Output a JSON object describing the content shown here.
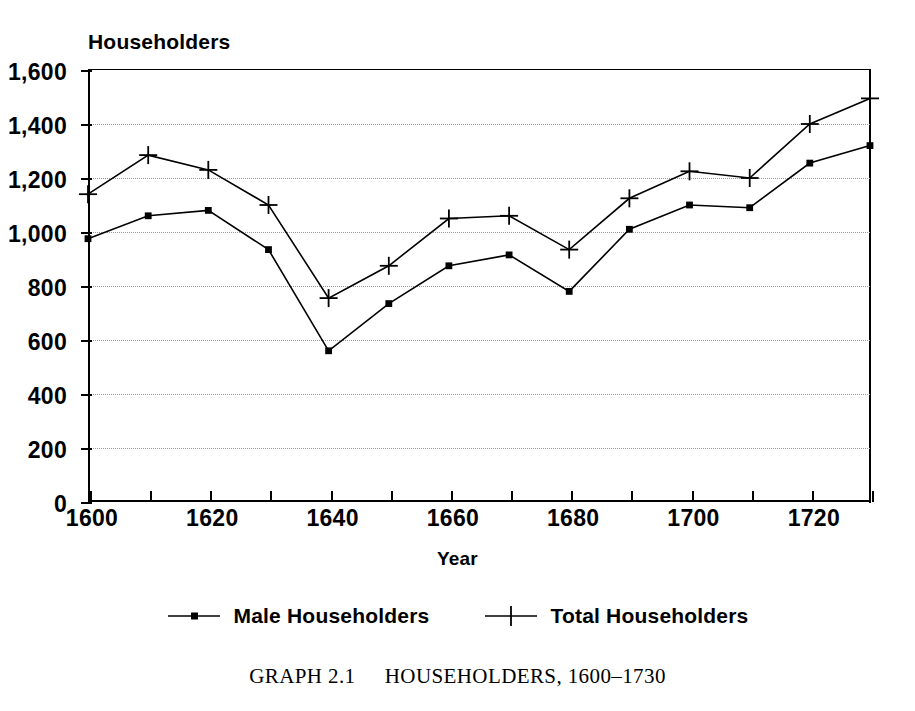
{
  "chart_data": {
    "type": "line",
    "title": "",
    "caption_label": "GRAPH 2.1",
    "caption_text": "HOUSEHOLDERS, 1600–1730",
    "xlabel": "Year",
    "ylabel": "Householders",
    "xlim": [
      1600,
      1730
    ],
    "ylim": [
      0,
      1600
    ],
    "grid": true,
    "legend_position": "bottom",
    "x": [
      1600,
      1610,
      1620,
      1630,
      1640,
      1650,
      1660,
      1670,
      1680,
      1690,
      1700,
      1710,
      1720,
      1730
    ],
    "xticks_major": [
      1600,
      1620,
      1640,
      1660,
      1680,
      1700,
      1720
    ],
    "xtick_labels": [
      "1600",
      "1620",
      "1640",
      "1660",
      "1680",
      "1700",
      "1720"
    ],
    "xticks_minor": [
      1610,
      1630,
      1650,
      1670,
      1690,
      1710,
      1730
    ],
    "yticks": [
      0,
      200,
      400,
      600,
      800,
      1000,
      1200,
      1400,
      1600
    ],
    "ytick_labels": [
      "0",
      "200",
      "400",
      "600",
      "800",
      "1,000",
      "1,200",
      "1,400",
      "1,600"
    ],
    "series": [
      {
        "name": "Male Householders",
        "marker": "square-dot",
        "values": [
          975,
          1060,
          1080,
          935,
          560,
          735,
          875,
          915,
          780,
          1010,
          1100,
          1090,
          1255,
          1320
        ]
      },
      {
        "name": "Total Householders",
        "marker": "plus",
        "values": [
          1140,
          1285,
          1230,
          1100,
          755,
          875,
          1050,
          1060,
          935,
          1125,
          1225,
          1200,
          1400,
          1495
        ]
      }
    ]
  },
  "colors": {
    "line": "#000000",
    "grid": "#9a9a9a",
    "axis": "#000000",
    "background": "#ffffff"
  }
}
